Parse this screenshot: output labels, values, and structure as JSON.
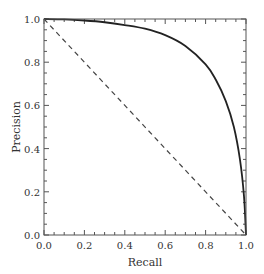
{
  "chart_data": {
    "type": "line",
    "title": "",
    "xlabel": "Recall",
    "ylabel": "Precision",
    "xlim": [
      0.0,
      1.0
    ],
    "ylim": [
      0.0,
      1.0
    ],
    "xticks": [
      "0.0",
      "0.2",
      "0.4",
      "0.6",
      "0.8",
      "1.0"
    ],
    "yticks": [
      "0.0",
      "0.2",
      "0.4",
      "0.6",
      "0.8",
      "1.0"
    ],
    "grid": false,
    "legend": null,
    "series": [
      {
        "name": "precision-recall-curve",
        "style": "solid",
        "color": "#222222",
        "x": [
          0.0,
          0.1,
          0.2,
          0.3,
          0.4,
          0.5,
          0.6,
          0.7,
          0.8,
          0.85,
          0.9,
          0.94,
          0.97,
          0.99,
          1.0
        ],
        "y": [
          1.0,
          0.998,
          0.993,
          0.985,
          0.972,
          0.955,
          0.925,
          0.875,
          0.79,
          0.72,
          0.62,
          0.5,
          0.35,
          0.18,
          0.0
        ]
      },
      {
        "name": "random-baseline",
        "style": "dashed",
        "color": "#444444",
        "x": [
          0.0,
          1.0
        ],
        "y": [
          1.0,
          0.0
        ]
      }
    ]
  }
}
